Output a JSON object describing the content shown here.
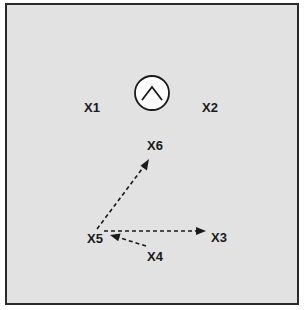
{
  "diagram": {
    "background_color": "#e2e2e2",
    "border_color": "#2a2a2a",
    "center_symbol": {
      "icon": "caret-up-in-circle-icon"
    },
    "nodes": [
      {
        "id": "X1",
        "label": "X1"
      },
      {
        "id": "X2",
        "label": "X2"
      },
      {
        "id": "X3",
        "label": "X3"
      },
      {
        "id": "X4",
        "label": "X4"
      },
      {
        "id": "X5",
        "label": "X5"
      },
      {
        "id": "X6",
        "label": "X6"
      }
    ],
    "edges": [
      {
        "from": "X5",
        "to": "X6",
        "style": "dashed-arrow"
      },
      {
        "from": "X5",
        "to": "X3",
        "style": "dashed-arrow"
      },
      {
        "from": "X4",
        "to": "X5",
        "style": "dashed-arrow"
      }
    ]
  }
}
